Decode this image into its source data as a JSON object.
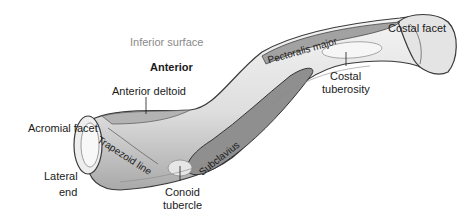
{
  "figure": {
    "colors": {
      "bone_fill": "#e9e9e9",
      "bone_shade": "#b9b9b9",
      "bone_outline": "#3a3a3a",
      "muscle_fill": "#8f8f8f",
      "label_text": "#1a1a1a",
      "secondary_text": "#8a8a8a"
    }
  },
  "labels": {
    "inferior_surface": "Inferior surface",
    "anterior": "Anterior",
    "anterior_deltoid": "Anterior deltoid",
    "acromial_facet": "Acromial facet",
    "lateral_end_line1": "Lateral",
    "lateral_end_line2": "end",
    "trapezoid_line": "Trapezoid line",
    "subclavius": "Subclavius",
    "conoid_tubercle_line1": "Conoid",
    "conoid_tubercle_line2": "tubercle",
    "pectoralis_major": "Pectoralis major",
    "costal_facet": "Costal facet",
    "costal_tuberosity_line1": "Costal",
    "costal_tuberosity_line2": "tuberosity"
  }
}
